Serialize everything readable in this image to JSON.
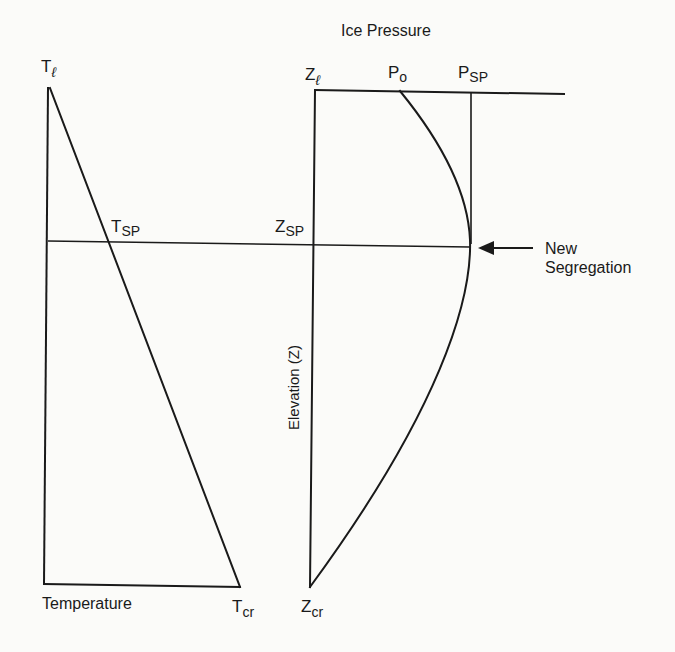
{
  "title": "Ice Pressure",
  "temperature_panel": {
    "axis_label": "Temperature",
    "top_label": {
      "main": "T",
      "sub": "ℓ"
    },
    "split_label": {
      "main": "T",
      "sub": "SP"
    },
    "bottom_label": {
      "main": "T",
      "sub": "cr"
    }
  },
  "pressure_panel": {
    "axis_label": "Elevation (Z)",
    "top_label": {
      "main": "Z",
      "sub": "ℓ"
    },
    "split_label": {
      "main": "Z",
      "sub": "SP"
    },
    "bottom_label": {
      "main": "Z",
      "sub": "cr"
    },
    "p0_label": {
      "main": "P",
      "sub": "o"
    },
    "psp_label": {
      "main": "P",
      "sub": "SP"
    }
  },
  "annotation": {
    "line1": "New",
    "line2": "Segregation",
    "arrow": "left-arrow"
  },
  "colors": {
    "ink": "#1a1a1a",
    "paper": "#fbfbf9"
  }
}
